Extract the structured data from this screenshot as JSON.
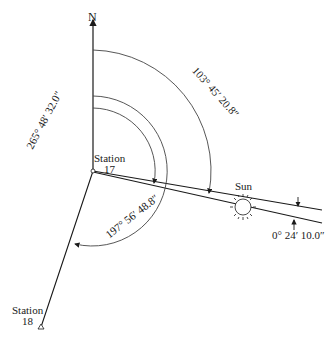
{
  "diagram": {
    "north_label": "N",
    "station_17": {
      "name": "Station",
      "number": "17"
    },
    "station_18": {
      "name": "Station",
      "number": "18"
    },
    "sun_label": "Sun",
    "angles": {
      "azimuth_sun": "103° 45′ 20.8″",
      "azimuth_station18": "197° 56′ 48.8″",
      "angle_left": "265° 48′ 32.0″",
      "sun_semidiameter": "0° 24′ 10.0″"
    },
    "colors": {
      "line": "#1a1a1a",
      "arc": "#555555",
      "background": "#ffffff"
    }
  }
}
